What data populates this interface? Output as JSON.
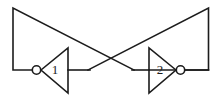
{
  "figure": {
    "name": "cross-coupled-inverter-latch",
    "title": "Cross-coupled inverter pair (bistable latch)",
    "background_color": "#ffffff",
    "line_color": "#1c1c1c",
    "width": 222,
    "height": 98
  },
  "gates": [
    {
      "id": "gate-1",
      "label": "1",
      "type": "inverter",
      "orientation": "pointing-left",
      "bubble_side": "left",
      "label_x": 55,
      "label_y": 70,
      "triangle_points": "41,70 68,48 68,93",
      "bubble_cx": 36.5,
      "bubble_cy": 70,
      "bubble_r": 4.2
    },
    {
      "id": "gate-2",
      "label": "2",
      "type": "inverter",
      "orientation": "pointing-right",
      "bubble_side": "right",
      "label_x": 160,
      "label_y": 70,
      "triangle_points": "176,70 149,48 149,93",
      "bubble_cx": 180.5,
      "bubble_cy": 70,
      "bubble_r": 4.2
    }
  ],
  "wires": [
    {
      "id": "wire-gate1-input-feedback",
      "description": "From gate 1 input bubble left, up the left rail, then diagonally down-right to gate 2 output node",
      "path": "M 32.3,70 L 13,70 L 13,8 L 134,70"
    },
    {
      "id": "wire-gate2-input-feedback",
      "description": "From gate 2 input base left, then diagonally up-right along the right rail down to gate 1 output node",
      "path": "M 149,70 L 208.5,70 L 208.5,8 L 88,70"
    },
    {
      "id": "wire-gate1-output",
      "description": "Gate 1 output stub running right from the triangle base",
      "path": "M 68,70 L 90,70"
    },
    {
      "id": "wire-gate2-output",
      "description": "Gate 2 output stub running right from the bubble to the right rail",
      "path": "M 184.7,70 L 208.5,70"
    },
    {
      "id": "wire-gate2-input-stub",
      "description": "Short stub entering gate 2 triangle base from the left",
      "path": "M 132,70 L 149,70"
    }
  ],
  "nodes": [
    {
      "id": "crossing-point",
      "x": 111,
      "y": 46,
      "description": "Diagonal feedback wires cross here"
    },
    {
      "id": "gate1-output-node",
      "x": 88,
      "y": 70,
      "description": "Gate 1 output / gate 2 input net"
    },
    {
      "id": "gate2-output-node",
      "x": 134,
      "y": 70,
      "description": "Gate 2 output / gate 1 input net"
    }
  ]
}
